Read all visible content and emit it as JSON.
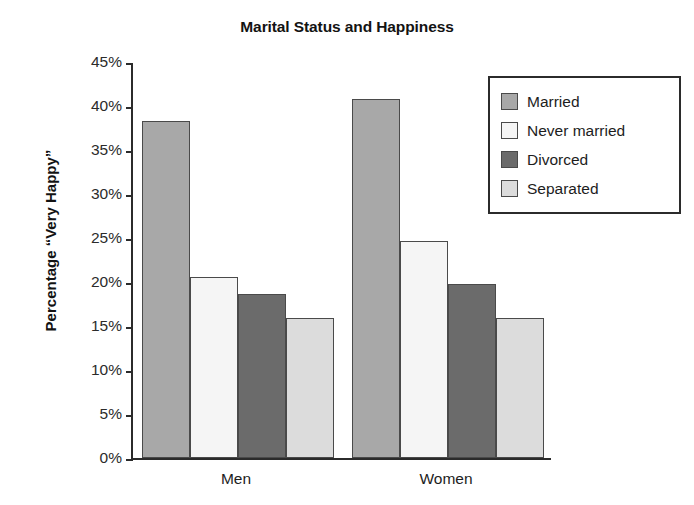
{
  "chart_data": {
    "type": "bar",
    "title": "Marital Status and Happiness",
    "xlabel": "",
    "ylabel": "Percentage “Very Happy”",
    "categories": [
      "Men",
      "Women"
    ],
    "series": [
      {
        "name": "Married",
        "values": [
          38.3,
          40.8
        ],
        "color": "#a8a8a8"
      },
      {
        "name": "Never married",
        "values": [
          20.6,
          24.7
        ],
        "color": "#f5f5f5"
      },
      {
        "name": "Divorced",
        "values": [
          18.6,
          19.8
        ],
        "color": "#6b6b6b"
      },
      {
        "name": "Separated",
        "values": [
          15.9,
          15.9
        ],
        "color": "#dcdcdc"
      }
    ],
    "ylim": [
      0,
      45
    ],
    "ytick_step": 5,
    "ytick_labels": [
      "0%",
      "5%",
      "10%",
      "15%",
      "20%",
      "25%",
      "30%",
      "35%",
      "40%",
      "45%"
    ],
    "ytick_values": [
      0,
      5,
      10,
      15,
      20,
      25,
      30,
      35,
      40,
      45
    ],
    "grid": false,
    "legend_position": "top-right",
    "legend_entries": [
      "Married",
      "Never married",
      "Divorced",
      "Separated"
    ],
    "bar_border_color": "#4a4a4a",
    "axis_color": "#2b2b2b",
    "background": "#ffffff"
  }
}
